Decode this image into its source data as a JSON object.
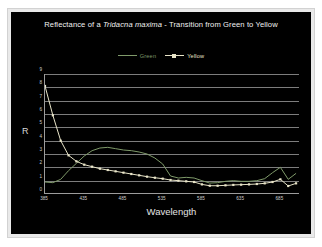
{
  "chart_data": {
    "type": "line",
    "title_prefix": "Reflectance of a ",
    "title_species": "Tridacna maxima",
    "title_suffix": " - Transition from Green to Yellow",
    "title": "Reflectance of a Tridacna maxima - Transition from Green to Yellow",
    "xlabel": "Wavelength",
    "ylabel": "R",
    "xlim": [
      385,
      710
    ],
    "ylim": [
      0,
      9
    ],
    "xticks": [
      385,
      435,
      485,
      535,
      585,
      635,
      685
    ],
    "xtick_labels": [
      "385",
      "435",
      "485",
      "535",
      "585",
      "635",
      "685"
    ],
    "yticks": [
      0,
      1,
      2,
      3,
      4,
      5,
      6,
      7,
      8,
      9
    ],
    "ytick_labels": [
      "0",
      "1",
      "2",
      "3",
      "4",
      "5",
      "6",
      "7",
      "8",
      "9"
    ],
    "grid": "horizontal",
    "legend_position": "top-center",
    "colors": {
      "green": "#7f9a6a",
      "yellow": "#e8e4c8",
      "gridline": "#7d7d7d",
      "axis": "#9c9c9c",
      "text": "#dcdcdc",
      "panel_background": "#000000",
      "page_background": "#ffffff"
    },
    "series": [
      {
        "name": "Green",
        "marker": "none",
        "color": "#7f9a6a",
        "x": [
          385,
          395,
          405,
          415,
          425,
          435,
          445,
          455,
          465,
          475,
          485,
          495,
          505,
          515,
          525,
          535,
          545,
          555,
          565,
          575,
          585,
          595,
          605,
          615,
          625,
          635,
          645,
          655,
          665,
          675,
          685,
          695,
          705
        ],
        "values": [
          0.9,
          0.85,
          1.1,
          1.75,
          2.3,
          2.85,
          3.25,
          3.45,
          3.5,
          3.4,
          3.3,
          3.25,
          3.15,
          3.0,
          2.7,
          2.25,
          1.35,
          1.2,
          1.25,
          1.2,
          1.0,
          0.82,
          0.85,
          0.95,
          1.0,
          0.95,
          0.95,
          1.0,
          1.15,
          1.6,
          2.0,
          1.1,
          1.55
        ]
      },
      {
        "name": "Yellow",
        "marker": "square",
        "color": "#e8e4c8",
        "x": [
          385,
          395,
          405,
          415,
          425,
          435,
          445,
          455,
          465,
          475,
          485,
          495,
          505,
          515,
          525,
          535,
          545,
          555,
          565,
          575,
          585,
          595,
          605,
          615,
          625,
          635,
          645,
          655,
          665,
          675,
          685,
          695,
          705
        ],
        "values": [
          8.1,
          5.9,
          4.0,
          2.9,
          2.45,
          2.2,
          2.05,
          1.9,
          1.8,
          1.7,
          1.6,
          1.5,
          1.4,
          1.3,
          1.22,
          1.15,
          1.05,
          1.0,
          0.95,
          0.9,
          0.72,
          0.62,
          0.62,
          0.65,
          0.68,
          0.7,
          0.72,
          0.75,
          0.8,
          0.9,
          1.1,
          0.6,
          0.8
        ]
      }
    ]
  }
}
